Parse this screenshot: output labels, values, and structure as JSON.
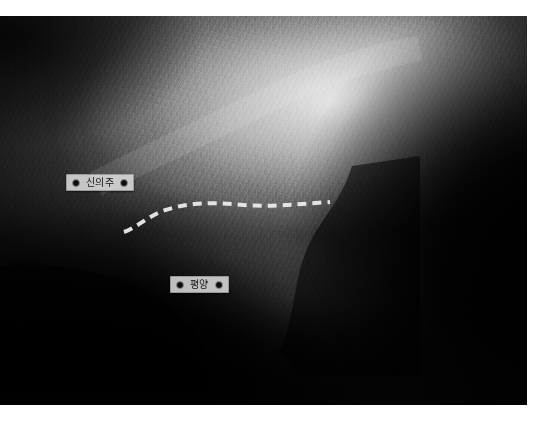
{
  "map": {
    "type": "shaded-relief-satellite",
    "palette": "grayscale",
    "page_background": "#ffffff",
    "plate_background": "#0a0a0a"
  },
  "labels": [
    {
      "id": "sinuiju",
      "name": "신의주",
      "left_marker": "dot-marker",
      "right_marker": "dot-marker"
    },
    {
      "id": "pyongyang",
      "name": "평양",
      "left_marker": "dot-marker",
      "right_marker": "dot-marker"
    }
  ],
  "route": {
    "name": "dashed-route-line",
    "color": "#eceaea",
    "style": "dashed",
    "width": 4,
    "dash": "9 6"
  }
}
